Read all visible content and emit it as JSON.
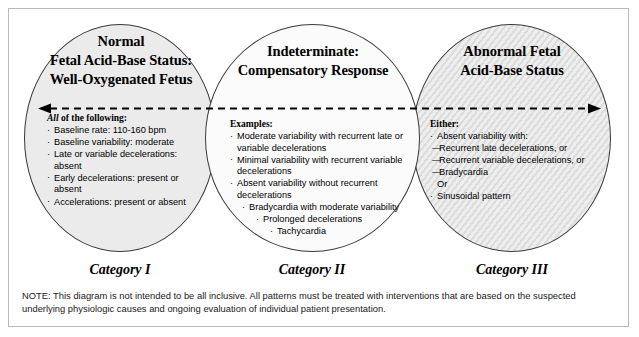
{
  "diagram": {
    "arrow": {
      "name": "fetal-status-spectrum-arrow",
      "left_head": "◄",
      "right_head": "►"
    },
    "circles": [
      {
        "id": "category-1",
        "heading_lines": [
          "Normal",
          "Fetal Acid-Base Status:",
          "Well-Oxygenated Fetus"
        ],
        "list_title_emphasis": "All",
        "list_title_rest": " of the following:",
        "bullet_glyph": "·",
        "items": [
          {
            "text": "Baseline rate: 110-160 bpm",
            "level": 0
          },
          {
            "text": "Baseline variability: moderate",
            "level": 0
          },
          {
            "text": "Late or variable decelerations: absent",
            "level": 0
          },
          {
            "text": "Early decelerations: present or absent",
            "level": 0
          },
          {
            "text": "Accelerations: present or absent",
            "level": 0
          }
        ],
        "caption": "Category I",
        "fill_color": "#ebebeb"
      },
      {
        "id": "category-2",
        "heading_lines": [
          "Indeterminate:",
          "Compensatory Response"
        ],
        "list_title_emphasis": "",
        "list_title_rest": "Examples:",
        "bullet_glyph": "·",
        "items": [
          {
            "text": "Moderate variability with recurrent late or variable decelerations",
            "level": 0
          },
          {
            "text": "Minimal variability with recurrent variable decelerations",
            "level": 0
          },
          {
            "text": "Absent variability without recurrent decelerations",
            "level": 0
          },
          {
            "text": "Bradycardia with moderate variability",
            "level": 1
          },
          {
            "text": "Prolonged decelerations",
            "level": 2
          },
          {
            "text": "Tachycardia",
            "level": 3
          }
        ],
        "caption": "Category II",
        "fill_color": "#fbfbfb"
      },
      {
        "id": "category-3",
        "heading_lines": [
          "Abnormal Fetal",
          "Acid-Base Status"
        ],
        "list_title_emphasis": "",
        "list_title_rest": "Either:",
        "bullet_glyph": "·",
        "items": [
          {
            "text": "Absent variability with:",
            "level": 0,
            "marker": "bullet"
          },
          {
            "text": "Recurrent late decelerations, or",
            "level": 0,
            "marker": "dash"
          },
          {
            "text": "Recurrent variable decelerations, or",
            "level": 0,
            "marker": "dash"
          },
          {
            "text": "Bradycardia",
            "level": 0,
            "marker": "dash"
          },
          {
            "text": "Or",
            "level": 0,
            "marker": "none"
          },
          {
            "text": "Sinusoidal pattern",
            "level": 0,
            "marker": "bullet"
          }
        ],
        "caption": "Category III",
        "fill_color": "#e2e2e2"
      }
    ],
    "note": "NOTE: This diagram is not intended to be all inclusive. All patterns must be treated with interventions that are based on the suspected underlying physiologic causes and ongoing evaluation of individual patient presentation."
  }
}
